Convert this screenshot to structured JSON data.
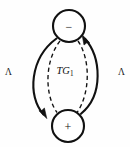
{
  "figure": {
    "width": 130,
    "height": 147,
    "background_color": "#fefefe",
    "stroke_color": "#111111",
    "center_label_text": "TG",
    "center_label_subscript": "1",
    "left_label": "Λ",
    "right_label": "Λ"
  },
  "nodes": [
    {
      "id": "node-minus",
      "sign": "−",
      "cx": 69,
      "cy": 26,
      "r": 16
    },
    {
      "id": "node-plus",
      "sign": "+",
      "cx": 68,
      "cy": 126,
      "r": 16
    }
  ],
  "edges": [
    {
      "id": "edge-left-solid",
      "style": "solid",
      "direction": "down",
      "from": "node-minus",
      "to": "node-plus"
    },
    {
      "id": "edge-right-solid",
      "style": "solid",
      "direction": "up",
      "from": "node-plus",
      "to": "node-minus"
    },
    {
      "id": "edge-left-dashed",
      "style": "dashed",
      "direction": "none",
      "from": "node-minus",
      "to": "node-plus"
    },
    {
      "id": "edge-right-dashed",
      "style": "dashed",
      "direction": "none",
      "from": "node-minus",
      "to": "node-plus"
    }
  ]
}
